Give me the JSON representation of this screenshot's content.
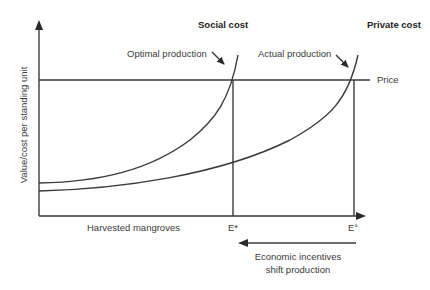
{
  "diagram": {
    "y_axis_label": "Value/cost per standing unit",
    "x_axis_label": "Harvested mangroves",
    "curves": {
      "social_cost": "Social cost",
      "private_cost": "Private cost",
      "price": "Price"
    },
    "annotations": {
      "optimal": "Optimal production",
      "actual": "Actual production",
      "incentive_line1": "Economic incentives",
      "incentive_line2": "shift production"
    },
    "x_marks": {
      "e_star": "E*",
      "e_zero": "E°"
    },
    "colors": {
      "line": "#3a3a3a",
      "text": "#3a3a3a",
      "background": "#ffffff"
    }
  }
}
